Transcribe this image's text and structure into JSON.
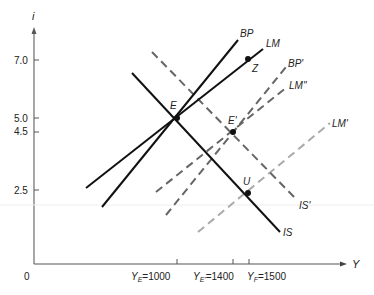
{
  "diagram": {
    "type": "IS-LM-BP",
    "axes": {
      "y_label": "i",
      "x_label": "Y",
      "origin_label": "0",
      "y_ticks": [
        "7.0",
        "5.0",
        "4.5",
        "2.5"
      ],
      "x_ticks": [
        {
          "main": "Y",
          "sub": "E",
          "value": "=1000"
        },
        {
          "main": "Y",
          "sub": "E'",
          "value": "=1400"
        },
        {
          "main": "Y",
          "sub": "F",
          "value": "=1500"
        }
      ]
    },
    "curves": [
      {
        "id": "IS",
        "label": "IS",
        "style": "solid",
        "color": "#111111"
      },
      {
        "id": "IS_prime",
        "label": "IS'",
        "style": "dashed",
        "color": "#666666"
      },
      {
        "id": "BP",
        "label": "BP",
        "style": "solid",
        "color": "#111111"
      },
      {
        "id": "LM",
        "label": "LM",
        "style": "solid",
        "color": "#111111"
      },
      {
        "id": "BP_prime",
        "label": "BP'",
        "style": "dashed",
        "color": "#666666"
      },
      {
        "id": "LM_double_prime",
        "label": "LM''",
        "style": "dashed",
        "color": "#666666"
      },
      {
        "id": "LM_prime",
        "label": "LM'",
        "style": "dashed",
        "color": "#aaaaaa"
      }
    ],
    "points": [
      {
        "id": "E",
        "label": "E",
        "Y": 1000,
        "i": 5.0
      },
      {
        "id": "E_prime",
        "label": "E'",
        "Y": 1400,
        "i": 4.5
      },
      {
        "id": "U",
        "label": "U",
        "Y": 1500,
        "i": 2.5
      },
      {
        "id": "Z",
        "label": "Z",
        "Y": 1500,
        "i": 7.0
      }
    ]
  }
}
